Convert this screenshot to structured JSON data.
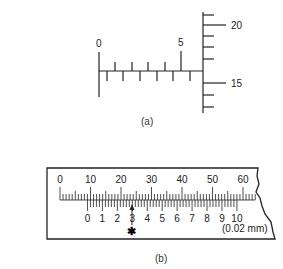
{
  "figure_a": {
    "caption": "(a)",
    "horizontal_scale": {
      "labels": [
        "0",
        "5"
      ],
      "divisions": 6
    },
    "vertical_scale": {
      "labels": [
        "20",
        "15"
      ]
    }
  },
  "figure_b": {
    "caption": "(b)",
    "main_scale": {
      "labels": [
        "0",
        "10",
        "20",
        "30",
        "40",
        "50",
        "60"
      ]
    },
    "vernier_scale": {
      "labels": [
        "0",
        "1",
        "2",
        "3",
        "4",
        "5",
        "6",
        "7",
        "8",
        "9",
        "10"
      ]
    },
    "unit_note": "(0.02 mm)",
    "marker": "✱"
  }
}
